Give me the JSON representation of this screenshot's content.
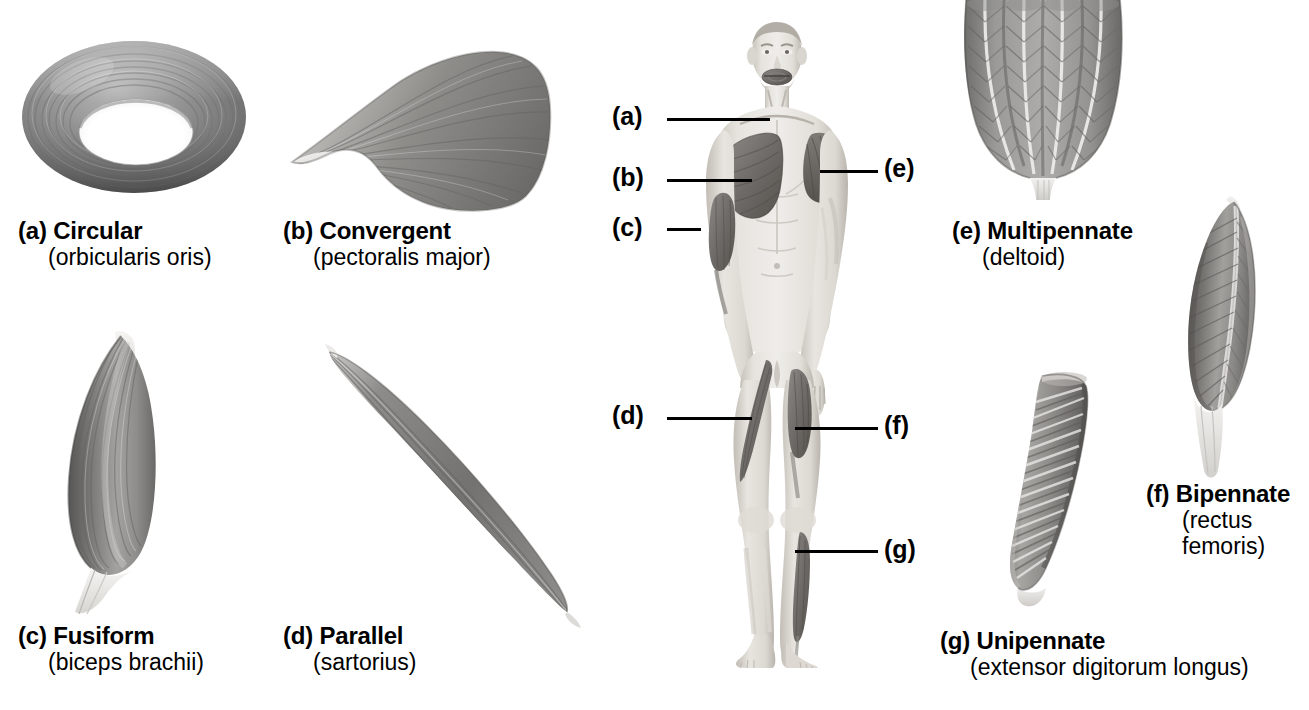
{
  "figure": {
    "background": "#ffffff",
    "text_color": "#000000"
  },
  "captions": [
    {
      "key": "a",
      "marker": "(a)",
      "title": "(a) Circular",
      "name": "Circular",
      "example": "(orbicularis oris)",
      "x": 18,
      "y": 218
    },
    {
      "key": "b",
      "marker": "(b)",
      "title": "(b) Convergent",
      "name": "Convergent",
      "example": "(pectoralis major)",
      "x": 283,
      "y": 218
    },
    {
      "key": "c",
      "marker": "(c)",
      "title": "(c) Fusiform",
      "name": "Fusiform",
      "example": "(biceps brachii)",
      "x": 18,
      "y": 623
    },
    {
      "key": "d",
      "marker": "(d)",
      "title": "(d) Parallel",
      "name": "Parallel",
      "example": "(sartorius)",
      "x": 283,
      "y": 623
    },
    {
      "key": "e",
      "marker": "(e)",
      "title": "(e) Multipennate",
      "name": "Multipennate",
      "example": "(deltoid)",
      "x": 952,
      "y": 218
    },
    {
      "key": "f",
      "marker": "(f)",
      "title": "(f) Bipennate",
      "name": "Bipennate",
      "example": "(rectus femoris)",
      "example_line1": "(rectus",
      "example_line2": "femoris)",
      "x": 1146,
      "y": 481
    },
    {
      "key": "g",
      "marker": "(g)",
      "title": "(g) Unipennate",
      "name": "Unipennate",
      "example": "(extensor digitorum longus)",
      "x": 940,
      "y": 628
    }
  ],
  "callouts": [
    {
      "key": "a",
      "label": "(a)",
      "side": "left",
      "x": 612,
      "y": 104,
      "line_x": 667,
      "line_y": 118,
      "line_w": 103
    },
    {
      "key": "b",
      "label": "(b)",
      "side": "left",
      "x": 612,
      "y": 165,
      "line_x": 667,
      "line_y": 179,
      "line_w": 85
    },
    {
      "key": "c",
      "label": "(c)",
      "side": "left",
      "x": 612,
      "y": 215,
      "line_x": 667,
      "line_y": 228,
      "line_w": 34
    },
    {
      "key": "d",
      "label": "(d)",
      "side": "left",
      "x": 612,
      "y": 403,
      "line_x": 667,
      "line_y": 417,
      "line_w": 85
    },
    {
      "key": "e",
      "label": "(e)",
      "side": "right",
      "x": 884,
      "y": 156,
      "line_x": 820,
      "line_y": 170,
      "line_w": 58
    },
    {
      "key": "f",
      "label": "(f)",
      "side": "right",
      "x": 884,
      "y": 413,
      "line_x": 795,
      "line_y": 427,
      "line_w": 83
    },
    {
      "key": "g",
      "label": "(g)",
      "side": "right",
      "x": 884,
      "y": 537,
      "line_x": 795,
      "line_y": 550,
      "line_w": 83
    }
  ],
  "body_figure": {
    "name": "anterior male body with highlighted muscles",
    "highlighted_muscles": [
      "orbicularis oris",
      "pectoralis major",
      "biceps brachii",
      "sartorius",
      "deltoid",
      "rectus femoris",
      "extensor digitorum longus"
    ]
  },
  "palette": {
    "muscle_dark": "#5c5c5c",
    "muscle_mid": "#8a8a8a",
    "muscle_light": "#c4c4c4",
    "tendon": "#e8e6e2",
    "skin_light": "#e9e6e1",
    "skin_mid": "#d4cfc8",
    "skin_shadow": "#b5afa7",
    "outline": "#000000"
  }
}
